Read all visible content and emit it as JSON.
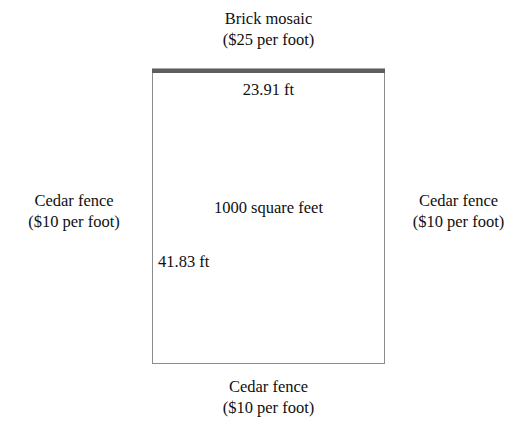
{
  "figure": {
    "background_color": "#ffffff",
    "text_color": "#101010"
  },
  "plot": {
    "area_label": "1000 square feet",
    "width_label": "23.91 ft",
    "height_label": "41.83 ft",
    "border_colors": {
      "brick_edge": "#5d5d5d",
      "fence_edge": "#8d8d8d"
    }
  },
  "sides": {
    "top": {
      "material": "Brick mosaic",
      "price": "($25 per foot)"
    },
    "bottom": {
      "material": "Cedar fence",
      "price": "($10 per foot)"
    },
    "left": {
      "material": "Cedar fence",
      "price": "($10 per foot)"
    },
    "right": {
      "material": "Cedar fence",
      "price": "($10 per foot)"
    }
  }
}
